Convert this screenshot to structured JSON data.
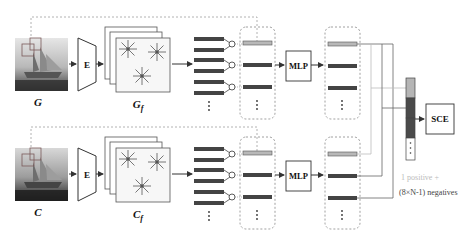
{
  "branches": [
    {
      "image_label": "G",
      "feature_label": "G",
      "feature_subscript": "f",
      "encoder_label": "E",
      "mlp_label": "MLP"
    },
    {
      "image_label": "C",
      "feature_label": "C",
      "feature_subscript": "f",
      "encoder_label": "E",
      "mlp_label": "MLP"
    }
  ],
  "loss": {
    "label": "SCE"
  },
  "annotation": {
    "line1": "1 positive +",
    "line2": "(8×N-1) negatives"
  },
  "colors": {
    "dark_bar": "#4a4a4a",
    "light_bar": "#b5b5b5",
    "line": "#555555",
    "dashed": "#9a9a9a",
    "positive_text": "#bbbbbb"
  }
}
